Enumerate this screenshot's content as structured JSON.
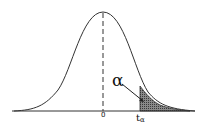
{
  "diagram": {
    "type": "t-distribution right-tail critical region",
    "labels": {
      "center": "0",
      "critical_value_base": "t",
      "critical_value_sub": "α",
      "area": "α"
    },
    "colors": {
      "curve": "#333333",
      "axis": "#333333",
      "shade": "#555555",
      "background": "#ffffff"
    }
  }
}
